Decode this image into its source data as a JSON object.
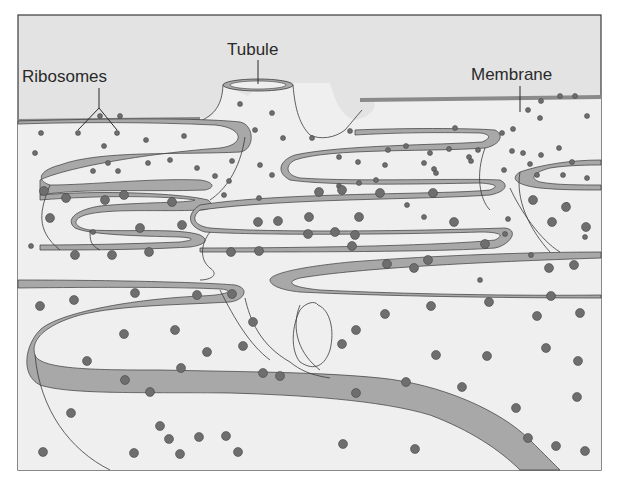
{
  "diagram": {
    "labels": {
      "ribosomes": "Ribosomes",
      "tubule": "Tubule",
      "membrane": "Membrane"
    },
    "colors": {
      "background": "#ffffff",
      "sky": "#e3e3e3",
      "lumen": "#efefef",
      "membrane_band": "#a8a8a8",
      "ribosome": "#6e6e6e",
      "outline": "#3a3a3a"
    }
  }
}
